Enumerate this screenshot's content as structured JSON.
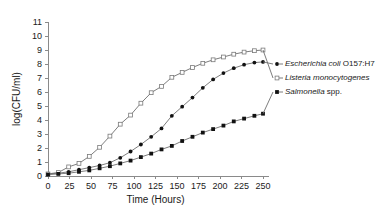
{
  "chart_data": {
    "type": "line",
    "title": "",
    "xlabel": "Time (Hours)",
    "ylabel": "log(CFU/ml)",
    "xlim": [
      0,
      250
    ],
    "ylim": [
      0,
      11
    ],
    "xticks": [
      0,
      25,
      50,
      75,
      100,
      125,
      150,
      175,
      200,
      225,
      250
    ],
    "yticks": [
      0,
      1,
      2,
      3,
      4,
      5,
      6,
      7,
      8,
      9,
      10,
      11
    ],
    "grid": false,
    "legend_position": "right",
    "x": [
      0,
      12,
      24,
      36,
      48,
      60,
      72,
      84,
      96,
      108,
      120,
      132,
      144,
      156,
      168,
      180,
      192,
      204,
      216,
      228,
      240,
      250
    ],
    "series": [
      {
        "name": "Escherichia coli O157:H7",
        "name_italic": "Escherichia coli",
        "name_roman": " O157:H7",
        "marker": "filled-circle",
        "color": "#111111",
        "values": [
          0.15,
          0.2,
          0.3,
          0.45,
          0.6,
          0.75,
          0.95,
          1.3,
          1.75,
          2.25,
          2.8,
          3.4,
          4.3,
          4.95,
          5.6,
          6.3,
          6.9,
          7.35,
          7.7,
          7.95,
          8.1,
          8.15
        ]
      },
      {
        "name": "Listeria monocytogenes",
        "name_italic": "Listeria monocytogenes",
        "name_roman": "",
        "marker": "open-square",
        "color": "#7a7a7a",
        "values": [
          0.15,
          0.25,
          0.65,
          0.9,
          1.4,
          2.05,
          2.85,
          3.7,
          4.35,
          5.2,
          5.95,
          6.4,
          7.05,
          7.4,
          7.75,
          8.05,
          8.3,
          8.5,
          8.7,
          8.85,
          8.95,
          9.0
        ]
      },
      {
        "name": "Salmonella spp.",
        "name_italic": "Salmonella",
        "name_roman": " spp.",
        "marker": "filled-square",
        "color": "#111111",
        "values": [
          0.1,
          0.15,
          0.2,
          0.3,
          0.4,
          0.55,
          0.7,
          0.9,
          1.1,
          1.35,
          1.6,
          1.9,
          2.15,
          2.5,
          2.8,
          3.1,
          3.35,
          3.6,
          3.9,
          4.1,
          4.3,
          4.45
        ]
      }
    ]
  },
  "legend": {
    "entries": [
      {
        "label": "Escherichia coli O157:H7",
        "italic": "Escherichia coli",
        "roman": " O157:H7"
      },
      {
        "label": "Listeria monocytogenes",
        "italic": "Listeria monocytogenes",
        "roman": ""
      },
      {
        "label": "Salmonella spp.",
        "italic": "Salmonella",
        "roman": " spp."
      }
    ]
  }
}
